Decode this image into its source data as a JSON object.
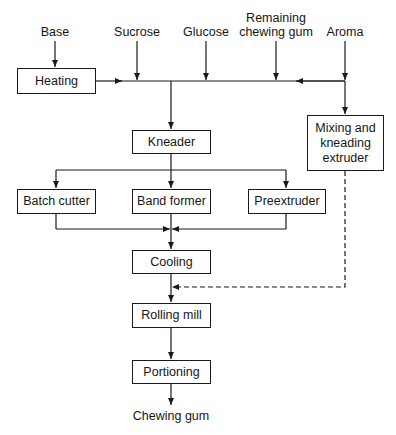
{
  "diagram": {
    "inputs": {
      "base": "Base",
      "sucrose": "Sucrose",
      "glucose": "Glucose",
      "remaining_gum_line1": "Remaining",
      "remaining_gum_line2": "chewing gum",
      "aroma": "Aroma"
    },
    "processes": {
      "heating": "Heating",
      "kneader": "Kneader",
      "mixing_line1": "Mixing and",
      "mixing_line2": "kneading",
      "mixing_line3": "extruder",
      "batch_cutter": "Batch cutter",
      "band_former": "Band former",
      "preextruder": "Preextruder",
      "cooling": "Cooling",
      "rolling_mill": "Rolling mill",
      "portioning": "Portioning"
    },
    "output": "Chewing gum",
    "edges": [
      {
        "from": "Base",
        "to": "Heating",
        "style": "solid"
      },
      {
        "from": "Heating",
        "to": "main-line",
        "style": "solid"
      },
      {
        "from": "Sucrose",
        "to": "main-line",
        "style": "solid"
      },
      {
        "from": "Glucose",
        "to": "main-line",
        "style": "solid"
      },
      {
        "from": "Remaining chewing gum",
        "to": "main-line",
        "style": "solid"
      },
      {
        "from": "Aroma",
        "to": "main-line",
        "style": "solid"
      },
      {
        "from": "main-line",
        "to": "Kneader",
        "style": "solid"
      },
      {
        "from": "main-line",
        "to": "Mixing and kneading extruder",
        "style": "solid"
      },
      {
        "from": "Kneader",
        "to": "Batch cutter",
        "style": "solid"
      },
      {
        "from": "Kneader",
        "to": "Band former",
        "style": "solid"
      },
      {
        "from": "Kneader",
        "to": "Preextruder",
        "style": "solid"
      },
      {
        "from": "Batch cutter",
        "to": "Cooling",
        "style": "solid"
      },
      {
        "from": "Band former",
        "to": "Cooling",
        "style": "solid"
      },
      {
        "from": "Preextruder",
        "to": "Cooling",
        "style": "solid"
      },
      {
        "from": "Cooling",
        "to": "Rolling mill",
        "style": "solid"
      },
      {
        "from": "Mixing and kneading extruder",
        "to": "Rolling mill",
        "style": "dashed"
      },
      {
        "from": "Rolling mill",
        "to": "Portioning",
        "style": "solid"
      },
      {
        "from": "Portioning",
        "to": "Chewing gum",
        "style": "solid"
      }
    ]
  }
}
